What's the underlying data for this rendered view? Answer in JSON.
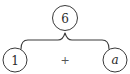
{
  "diagram": {
    "type": "expression-tree",
    "root": {
      "label": "6"
    },
    "children": [
      {
        "label": "1",
        "italic": false
      },
      {
        "operator": "+"
      },
      {
        "label": "a",
        "italic": true
      }
    ],
    "connector": "curly-brace",
    "colors": {
      "stroke": "#3a3a3a",
      "text": "#2a2a2a",
      "operator": "#555555"
    }
  }
}
